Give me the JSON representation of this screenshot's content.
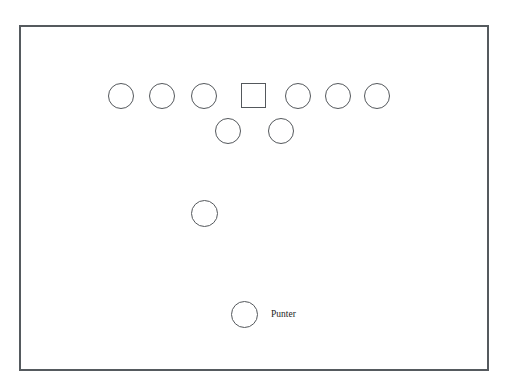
{
  "diagram": {
    "background_color": "#ffffff",
    "frame": {
      "name": "diagram-frame",
      "x": 19,
      "y": 25,
      "width": 470,
      "height": 346,
      "border_color": "#555a5e",
      "border_width": 2,
      "fill": "#ffffff"
    },
    "shape_style": {
      "stroke_color": "#54585c",
      "stroke_width": 1.4,
      "fill": "none"
    },
    "label_color": "#1d1d1d",
    "players": [
      {
        "id": "line-left-end",
        "shape": "circle",
        "cx": 120.5,
        "cy": 95.5,
        "size": 26,
        "label": ""
      },
      {
        "id": "line-left-tackle",
        "shape": "circle",
        "cx": 161.5,
        "cy": 95.5,
        "size": 26,
        "label": ""
      },
      {
        "id": "line-left-guard",
        "shape": "circle",
        "cx": 204.0,
        "cy": 95.5,
        "size": 26,
        "label": ""
      },
      {
        "id": "long-snapper",
        "shape": "square",
        "cx": 253.5,
        "cy": 95.5,
        "size": 25,
        "label": ""
      },
      {
        "id": "line-right-guard",
        "shape": "circle",
        "cx": 297.5,
        "cy": 95.5,
        "size": 26,
        "label": ""
      },
      {
        "id": "line-right-tackle",
        "shape": "circle",
        "cx": 337.5,
        "cy": 95.5,
        "size": 26,
        "label": ""
      },
      {
        "id": "line-right-end",
        "shape": "circle",
        "cx": 377.0,
        "cy": 95.5,
        "size": 26,
        "label": ""
      },
      {
        "id": "wing-left",
        "shape": "circle",
        "cx": 227.5,
        "cy": 130.5,
        "size": 26,
        "label": ""
      },
      {
        "id": "wing-right",
        "shape": "circle",
        "cx": 281.0,
        "cy": 130.5,
        "size": 26,
        "label": ""
      },
      {
        "id": "upback",
        "shape": "circle",
        "cx": 204.5,
        "cy": 213.5,
        "size": 27,
        "label": ""
      },
      {
        "id": "punter",
        "shape": "circle",
        "cx": 244.5,
        "cy": 314.0,
        "size": 27,
        "label": "Punter"
      }
    ],
    "labels": [
      {
        "id": "punter-label",
        "text": "Punter",
        "x": 271,
        "y": 310,
        "font_size": 9.5
      }
    ]
  },
  "chart_data": {
    "type": "scatter",
    "xlabel": "",
    "ylabel": "",
    "x": [
      120.5,
      161.5,
      204.0,
      253.5,
      297.5,
      337.5,
      377.0,
      227.5,
      281.0,
      204.5,
      244.5
    ],
    "y": [
      95.5,
      95.5,
      95.5,
      95.5,
      95.5,
      95.5,
      95.5,
      130.5,
      130.5,
      213.5,
      314.0
    ],
    "markers": [
      "circle",
      "circle",
      "circle",
      "square",
      "circle",
      "circle",
      "circle",
      "circle",
      "circle",
      "circle",
      "circle"
    ],
    "annotations": [
      "Punter"
    ],
    "legend": [],
    "grid": false,
    "xlim": [
      19,
      489
    ],
    "ylim": [
      371,
      25
    ]
  }
}
